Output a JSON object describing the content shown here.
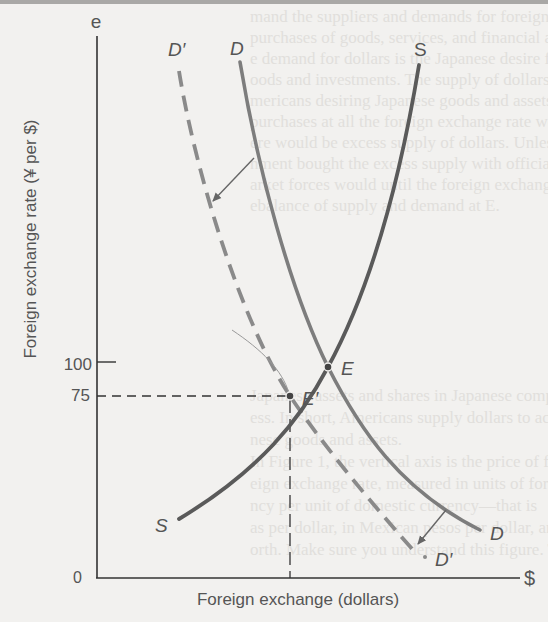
{
  "diagram": {
    "type": "supply-demand",
    "title": "",
    "axes": {
      "y_label": "Foreign exchange rate (¥ per $)",
      "y_symbol": "e",
      "x_label": "Foreign exchange (dollars)",
      "x_symbol": "$",
      "origin": "0",
      "y_ticks": [
        "100",
        "75"
      ]
    },
    "curves": {
      "supply_top": "S",
      "supply_bottom": "S",
      "demand_top": "D",
      "demand_bottom": "D",
      "new_demand_top": "D′",
      "new_demand_bottom": "D′"
    },
    "points": {
      "equilibrium": "E",
      "new_equilibrium": "E′"
    },
    "colors": {
      "supply": "#595959",
      "demand": "#7a7a7a",
      "new_demand": "#8a8a8a",
      "axes": "#333333",
      "background": "#f2f1ef"
    }
  },
  "background_text": {
    "lines_top": [
      "mand the suppliers and demands for foreign exchange",
      "purchases of goods, services, and financial assets. Amer",
      "e demand for dollars is the Japanese desire for Americ",
      "oods and investments. The supply of dollars comes fro",
      "mericans desiring Japanese goods and assets. If Amer",
      "purchases at all the foreign exchange rate were altere",
      "ere would be excess supply of dollars. Unless the Japa",
      "nment bought the excess supply with official res",
      "arket forces would until the foreign exchange rate",
      "ebalance of supply and demand at E."
    ],
    "lines_bottom": [
      "Japanese assets and shares in Japanese compa",
      "ess. In short, Americans supply dollars to acqui",
      "nese goods and assets.",
      "In Figure 1, the vertical axis is the price of fo",
      "eign exchange rate, measured in units of forei",
      "ncy per unit of domestic currency—that is",
      "as per dollar, in Mexican pesos per dollar, and",
      "orth. Make sure you understand this figure. The"
    ]
  }
}
